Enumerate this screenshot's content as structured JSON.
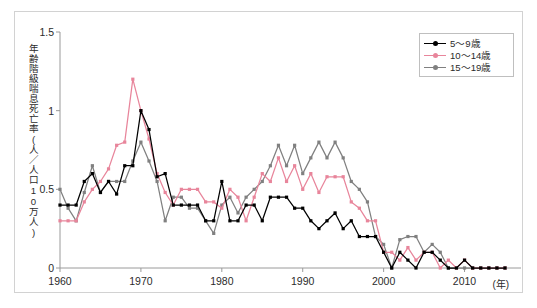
{
  "chart_data": {
    "type": "line",
    "title": "",
    "xlabel": "(年)",
    "ylabel": "年齢階級喘息死亡率(人／人口10万人)",
    "xlim": [
      1960,
      2015
    ],
    "ylim": [
      0,
      1.5
    ],
    "yticks": [
      0,
      0.5,
      1,
      1.5
    ],
    "ytick_labels": [
      "0",
      "0.5",
      "1",
      "1.5"
    ],
    "xticks": [
      1960,
      1970,
      1980,
      1990,
      2000,
      2010
    ],
    "xtick_labels": [
      "1960",
      "1970",
      "1980",
      "1990",
      "2000",
      "2010"
    ],
    "grid": false,
    "legend_position": "top-right",
    "x": [
      1960,
      1961,
      1962,
      1963,
      1964,
      1965,
      1966,
      1967,
      1968,
      1969,
      1970,
      1971,
      1972,
      1973,
      1974,
      1975,
      1976,
      1977,
      1978,
      1979,
      1980,
      1981,
      1982,
      1983,
      1984,
      1985,
      1986,
      1987,
      1988,
      1989,
      1990,
      1991,
      1992,
      1993,
      1994,
      1995,
      1996,
      1997,
      1998,
      1999,
      2000,
      2001,
      2002,
      2003,
      2004,
      2005,
      2006,
      2007,
      2008,
      2009,
      2010,
      2011,
      2012,
      2013,
      2014,
      2015
    ],
    "series": [
      {
        "name": "5〜9歳",
        "color": "#000000",
        "values": [
          0.4,
          0.4,
          0.4,
          0.55,
          0.6,
          0.48,
          0.55,
          0.47,
          0.65,
          0.65,
          1.0,
          0.88,
          0.58,
          0.6,
          0.4,
          0.4,
          0.4,
          0.4,
          0.3,
          0.3,
          0.55,
          0.3,
          0.3,
          0.4,
          0.4,
          0.3,
          0.45,
          0.45,
          0.45,
          0.38,
          0.38,
          0.3,
          0.25,
          0.3,
          0.35,
          0.25,
          0.3,
          0.2,
          0.2,
          0.2,
          0.1,
          0.0,
          0.1,
          0.05,
          0.0,
          0.1,
          0.1,
          0.05,
          0.0,
          0.0,
          0.05,
          0.0,
          0.0,
          0.0,
          0.0,
          0.0
        ]
      },
      {
        "name": "10〜14歳",
        "color": "#e8859b",
        "values": [
          0.3,
          0.3,
          0.3,
          0.42,
          0.5,
          0.55,
          0.63,
          0.78,
          0.8,
          1.2,
          1.0,
          0.82,
          0.6,
          0.48,
          0.4,
          0.5,
          0.5,
          0.5,
          0.42,
          0.42,
          0.38,
          0.5,
          0.45,
          0.3,
          0.45,
          0.6,
          0.55,
          0.7,
          0.55,
          0.65,
          0.5,
          0.6,
          0.48,
          0.58,
          0.58,
          0.58,
          0.42,
          0.38,
          0.3,
          0.3,
          0.1,
          0.1,
          0.05,
          0.13,
          0.05,
          0.1,
          0.1,
          0.0,
          0.05,
          0.0,
          0.05,
          0.0,
          0.0,
          0.0,
          0.0,
          0.0
        ]
      },
      {
        "name": "15〜19歳",
        "color": "#808080",
        "values": [
          0.5,
          0.38,
          0.3,
          0.48,
          0.65,
          0.48,
          0.55,
          0.55,
          0.55,
          0.68,
          0.8,
          0.68,
          0.55,
          0.3,
          0.45,
          0.45,
          0.38,
          0.38,
          0.3,
          0.22,
          0.4,
          0.45,
          0.35,
          0.45,
          0.5,
          0.55,
          0.65,
          0.78,
          0.65,
          0.78,
          0.6,
          0.7,
          0.8,
          0.7,
          0.8,
          0.7,
          0.55,
          0.5,
          0.42,
          0.2,
          0.15,
          0.0,
          0.18,
          0.2,
          0.2,
          0.1,
          0.15,
          0.1,
          0.0,
          0.0,
          0.0,
          0.0,
          0.0,
          0.0,
          0.0,
          0.0
        ]
      }
    ]
  },
  "legend": {
    "items": [
      {
        "label": "5〜9歳"
      },
      {
        "label": "10〜14歳"
      },
      {
        "label": "15〜19歳"
      }
    ]
  },
  "axis": {
    "y_title": "年齢階級喘息死亡率(人／人口10万人)",
    "x_unit": "(年)"
  }
}
